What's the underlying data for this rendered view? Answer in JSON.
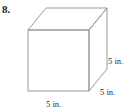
{
  "figure": {
    "problem_number": "8.",
    "shape": "cube",
    "background_color": "#ffffff",
    "line_color": "#999999",
    "text_color": "#2b2b2b",
    "labels": {
      "height": "5 in.",
      "depth": "5 in.",
      "width": "5 in."
    },
    "geometry": {
      "front_face": {
        "top_left": [
          28,
          30
        ],
        "top_right": [
          89,
          30
        ],
        "bottom_right": [
          89,
          91
        ],
        "bottom_left": [
          28,
          91
        ]
      },
      "back_offset": [
        18,
        -22
      ],
      "back_top_left": [
        46,
        8
      ],
      "back_top_right": [
        107,
        8
      ],
      "back_bottom_right": [
        107,
        69
      ]
    }
  }
}
